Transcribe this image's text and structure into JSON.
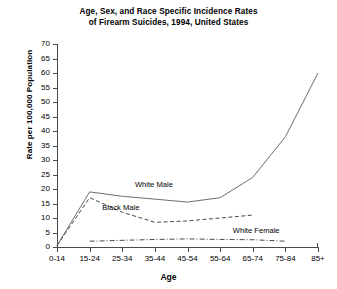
{
  "chart_data": {
    "type": "line",
    "title": "Age, Sex, and Race Specific Incidence Rates of Firearm Suicides, 1994, United States",
    "title_line1": "Age, Sex, and Race Specific Incidence Rates",
    "title_line2": "of Firearm Suicides, 1994, United States",
    "xlabel": "Age",
    "ylabel": "Rate per 100,000 Population",
    "categories": [
      "0-14",
      "15-24",
      "25-34",
      "35-44",
      "45-54",
      "55-64",
      "65-74",
      "75-84",
      "85+"
    ],
    "ylim": [
      0,
      70
    ],
    "yticks": [
      0,
      5,
      10,
      15,
      20,
      25,
      30,
      35,
      40,
      45,
      50,
      55,
      60,
      65,
      70
    ],
    "grid": false,
    "legend_position": "inline-annotations",
    "series": [
      {
        "name": "White Male",
        "style": "solid",
        "color": "#6e6e6e",
        "values": [
          0.5,
          19.0,
          17.5,
          16.5,
          15.5,
          17.0,
          24.0,
          38.0,
          60.0
        ]
      },
      {
        "name": "Black Male",
        "style": "dashed",
        "color": "#4a4a4a",
        "values": [
          0.5,
          17.0,
          12.0,
          8.5,
          9.0,
          10.0,
          11.0,
          null,
          null
        ]
      },
      {
        "name": "White Female",
        "style": "dash-dot",
        "color": "#4a4a4a",
        "values": [
          null,
          2.0,
          2.3,
          2.6,
          2.8,
          2.6,
          2.5,
          2.0,
          null
        ]
      }
    ],
    "annotations": [
      {
        "text": "White Male",
        "category": "35-44",
        "value": 21.5
      },
      {
        "text": "Black Male",
        "category": "25-34",
        "value": 13.5
      },
      {
        "text": "White Female",
        "category": "65-74",
        "value": 5.5
      }
    ]
  }
}
